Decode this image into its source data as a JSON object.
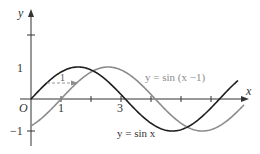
{
  "chart_data": {
    "type": "line",
    "title": "",
    "xlabel": "x",
    "ylabel": "y",
    "origin_label": "O",
    "xlim": [
      0,
      7.2
    ],
    "ylim": [
      -1.45,
      2.8
    ],
    "x_ticks": [
      1,
      2,
      3,
      4,
      5,
      6
    ],
    "x_tick_labels": [
      "1",
      "",
      "3",
      "",
      "",
      ""
    ],
    "y_ticks": [
      2,
      1,
      -1
    ],
    "y_tick_labels": [
      "",
      "1",
      "−1"
    ],
    "grid": false,
    "series": [
      {
        "name": "y = sin x",
        "function": "sin(x)",
        "x_range": [
          0,
          6.9
        ],
        "color": "#1e1e1e",
        "label_position": "below, near x=3.5"
      },
      {
        "name": "y = sin (x −1)",
        "function": "sin(x-1)",
        "x_range": [
          0,
          7.1
        ],
        "color": "#8c8c8c",
        "label_position": "above, near x=5"
      }
    ],
    "annotations": [
      {
        "type": "dashed-arrow",
        "from": [
          0.52,
          0.5
        ],
        "to": [
          1.52,
          0.5
        ],
        "text": "1",
        "meaning": "horizontal shift of 1 unit to the right"
      }
    ]
  },
  "labels": {
    "y_axis": "y",
    "x_axis": "x",
    "origin": "O",
    "tick_one_x": "1",
    "tick_three_x": "3",
    "tick_one_y": "1",
    "tick_neg_one_y": "−1",
    "shift_amount": "1",
    "sin_x": "y = sin x",
    "sin_x_minus_1": "y = sin (x −1)"
  }
}
